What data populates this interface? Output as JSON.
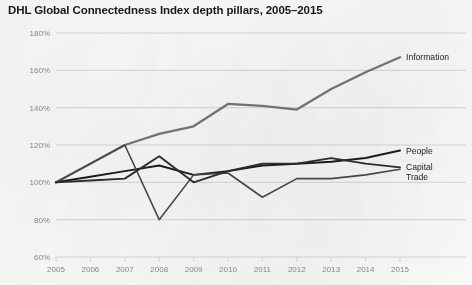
{
  "chart_title": "DHL Global Connectedness Index depth pillars, 2005–2015",
  "axes": {
    "y_ticks": [
      "60%",
      "80%",
      "100%",
      "120%",
      "140%",
      "160%",
      "180%"
    ],
    "x_ticks": [
      "2005",
      "2006",
      "2007",
      "2008",
      "2009",
      "2010",
      "2011",
      "2012",
      "2013",
      "2014",
      "2015"
    ]
  },
  "series_labels": {
    "information": "Information",
    "people": "People",
    "capital": "Capital",
    "trade": "Trade"
  },
  "colors": {
    "information": "#77777a",
    "people": "#1d1d1f",
    "capital": "#4a4a4d",
    "trade": "#2e2e31",
    "gridline": "#d8d8d6",
    "background": "#fbfbfa",
    "title": "#18181a",
    "tick_label": "#8b8b8c"
  },
  "chart_data": {
    "type": "line",
    "title": "DHL Global Connectedness Index depth pillars, 2005–2015",
    "xlabel": "",
    "ylabel": "",
    "x": [
      2005,
      2006,
      2007,
      2008,
      2009,
      2010,
      2011,
      2012,
      2013,
      2014,
      2015
    ],
    "xlim": [
      2005,
      2015
    ],
    "ylim": [
      60,
      180
    ],
    "y_unit": "percent",
    "grid": "horizontal",
    "legend_position": "right-inline",
    "series": [
      {
        "name": "Information",
        "color": "#77777a",
        "values": [
          100,
          110,
          120,
          126,
          130,
          142,
          141,
          139,
          150,
          159,
          167
        ]
      },
      {
        "name": "People",
        "color": "#1d1d1f",
        "values": [
          100,
          103,
          106,
          109,
          104,
          106,
          109,
          110,
          111,
          113,
          117
        ]
      },
      {
        "name": "Capital",
        "color": "#4a4a4d",
        "values": [
          100,
          110,
          120,
          80,
          104,
          105,
          92,
          102,
          102,
          104,
          107
        ]
      },
      {
        "name": "Trade",
        "color": "#2e2e31",
        "values": [
          100,
          101,
          102,
          114,
          100,
          106,
          110,
          110,
          113,
          110,
          108
        ]
      }
    ]
  }
}
